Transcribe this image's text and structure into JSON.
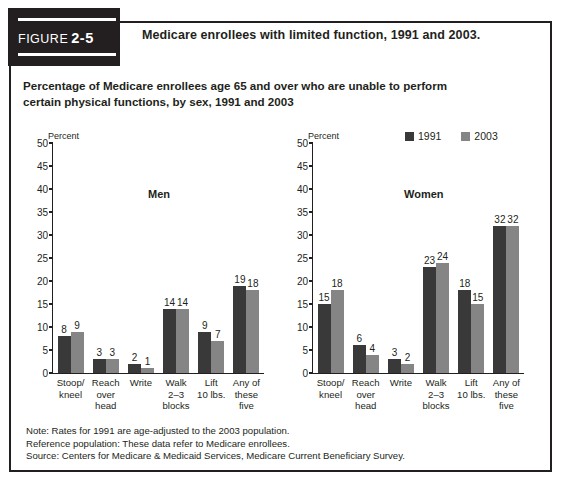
{
  "figure": {
    "label": "FIGURE",
    "number": "2-5",
    "title": "Medicare enrollees with limited function, 1991 and 2003."
  },
  "subtitle": "Percentage of Medicare enrollees age 65 and over who are unable to perform certain physical functions, by sex, 1991 and 2003",
  "legend": {
    "series": [
      {
        "name": "1991",
        "color": "#393939"
      },
      {
        "name": "2003",
        "color": "#858585"
      }
    ]
  },
  "panels": [
    {
      "id": "men",
      "label": "Men"
    },
    {
      "id": "women",
      "label": "Women"
    }
  ],
  "notes": [
    "Note: Rates for 1991 are age-adjusted to the 2003 population.",
    "Reference population: These data refer to Medicare enrollees.",
    "Source: Centers for Medicare & Medicaid Services, Medicare Current Beneficiary Survey."
  ],
  "chart_data": [
    {
      "type": "bar",
      "title": "Men",
      "xlabel": "",
      "ylabel": "Percent",
      "ylim": [
        0,
        50
      ],
      "yticks": [
        0,
        5,
        10,
        15,
        20,
        25,
        30,
        35,
        40,
        45,
        50
      ],
      "grid": false,
      "legend_position": "top-right (shared)",
      "categories": [
        "Stoop/\nkneel",
        "Reach\nover\nhead",
        "Write",
        "Walk\n2–3\nblocks",
        "Lift\n10 lbs.",
        "Any of\nthese\nfive"
      ],
      "series": [
        {
          "name": "1991",
          "color": "#393939",
          "values": [
            8,
            3,
            2,
            14,
            9,
            19
          ]
        },
        {
          "name": "2003",
          "color": "#858585",
          "values": [
            9,
            3,
            1,
            14,
            7,
            18
          ]
        }
      ]
    },
    {
      "type": "bar",
      "title": "Women",
      "xlabel": "",
      "ylabel": "Percent",
      "ylim": [
        0,
        50
      ],
      "yticks": [
        0,
        5,
        10,
        15,
        20,
        25,
        30,
        35,
        40,
        45,
        50
      ],
      "grid": false,
      "legend_position": "top-right",
      "categories": [
        "Stoop/\nkneel",
        "Reach\nover\nhead",
        "Write",
        "Walk\n2–3\nblocks",
        "Lift\n10 lbs.",
        "Any of\nthese\nfive"
      ],
      "series": [
        {
          "name": "1991",
          "color": "#393939",
          "values": [
            15,
            6,
            3,
            23,
            18,
            32
          ]
        },
        {
          "name": "2003",
          "color": "#858585",
          "values": [
            18,
            4,
            2,
            24,
            15,
            32
          ]
        }
      ]
    }
  ],
  "axis_unit_label": "Percent"
}
